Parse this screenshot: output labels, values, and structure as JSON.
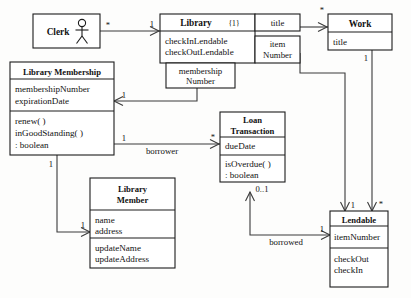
{
  "diagram": {
    "kind": "uml-class-diagram",
    "background_color": "#fdfdfc",
    "line_color": "#3a3a3a",
    "box_border_color": "#1c1c1c"
  },
  "classes": {
    "clerk": {
      "name": "Clerk",
      "actor_icon": "stick-figure-actor-icon"
    },
    "library": {
      "name": "Library",
      "annotation": "{1}",
      "operations": [
        "checkInLendable",
        "checkOutLendable"
      ]
    },
    "work": {
      "name": "Work",
      "attributes": [
        "title"
      ]
    },
    "library_membership": {
      "name": "Library Membership",
      "attributes": [
        "membershipNumber",
        "expirationDate"
      ],
      "operations": [
        "renew( )",
        "inGoodStanding( )",
        " : boolean"
      ]
    },
    "loan_transaction": {
      "name_line1": "Loan",
      "name_line2": "Transaction",
      "attributes": [
        "dueDate"
      ],
      "operations": [
        "isOverdue( )",
        " : boolean"
      ]
    },
    "library_member": {
      "name_line1": "Library",
      "name_line2": "Member",
      "attributes": [
        "name",
        "address"
      ],
      "operations": [
        "updateName",
        "updateAddress"
      ]
    },
    "lendable": {
      "name": "Lendable",
      "attributes": [
        "itemNumber"
      ],
      "operations": [
        "checkOut",
        "checkIn"
      ]
    }
  },
  "qualifiers": {
    "title": "title",
    "item_number_line1": "item",
    "item_number_line2": "Number",
    "membership_number_line1": "membership",
    "membership_number_line2": "Number"
  },
  "multiplicities": {
    "clerk_star": "*",
    "library_one": "1",
    "work_star": "*",
    "work_one": "1",
    "membership_one": "1",
    "borrower_one": "1",
    "loan_star": "*",
    "membership_bottom_one": "1",
    "member_one": "1",
    "loan_zero_one": "0..1",
    "borrowed_one": "1",
    "lendable_one": "1",
    "lendable_star": "*"
  },
  "roles": {
    "borrower": "borrower",
    "borrowed": "borrowed"
  }
}
